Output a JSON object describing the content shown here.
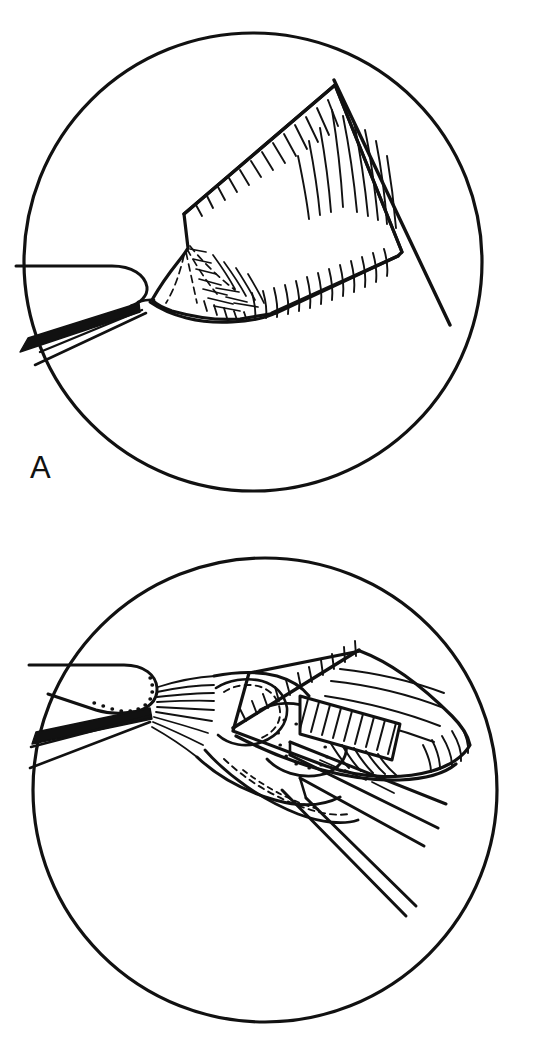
{
  "figure": {
    "kind": "surgical-technique-line-drawing",
    "medium": "black-and-white pen-and-ink illustration",
    "background_color": "#ffffff",
    "ink_color": "#111111",
    "panel_count": 2,
    "panel_frame_shape": "circle",
    "caption_note": "Two circular inset views, labelled A (upper) and B (lower)."
  },
  "panels": [
    {
      "id": "A",
      "label": "A",
      "label_position": {
        "x": 30,
        "y": 452
      },
      "frame": {
        "cx": 253,
        "cy": 262,
        "r": 229,
        "stroke_width": 3.2
      },
      "description": "Forceps entering from the left grasp a triangular tissue flap whose cut edge is marked with short hatch strokes; a straight probe crosses behind the flap from upper right to lower right.",
      "elements": [
        {
          "name": "forceps-upper-jaw",
          "kind": "instrument"
        },
        {
          "name": "forceps-lower-jaw",
          "kind": "instrument"
        },
        {
          "name": "tissue-flap",
          "kind": "anatomy"
        },
        {
          "name": "flap-cut-edge-hatching",
          "kind": "shading"
        },
        {
          "name": "flap-fold-lines",
          "kind": "shading"
        },
        {
          "name": "probe-line",
          "kind": "instrument"
        }
      ]
    },
    {
      "id": "B",
      "label": "B",
      "label_position": {
        "x": 30,
        "y": 960
      },
      "frame": {
        "cx": 265,
        "cy": 790,
        "r": 232,
        "stroke_width": 3.2
      },
      "description": "Forceps from the left hold the base of the tissue while a broad flap is folded back toward the upper right; retractor blades run out to the lower right and the deeper layers are drawn with dotted and hatched edges.",
      "elements": [
        {
          "name": "forceps-upper-jaw",
          "kind": "instrument"
        },
        {
          "name": "forceps-lower-jaw",
          "kind": "instrument"
        },
        {
          "name": "jaw-serration-dots",
          "kind": "detail"
        },
        {
          "name": "tissue-base",
          "kind": "anatomy"
        },
        {
          "name": "folded-flap",
          "kind": "anatomy"
        },
        {
          "name": "flap-cut-edge-hatching",
          "kind": "shading"
        },
        {
          "name": "deep-layer-hatching",
          "kind": "shading"
        },
        {
          "name": "retractor-blade-upper",
          "kind": "instrument"
        },
        {
          "name": "retractor-blade-lower",
          "kind": "instrument"
        }
      ]
    }
  ],
  "labels": {
    "panel_a": "A",
    "panel_b": "B"
  }
}
